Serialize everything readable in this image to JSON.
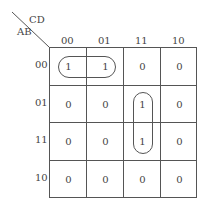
{
  "kmap": {
    "col_var": "CD",
    "row_var": "AB",
    "col_labels": [
      "00",
      "01",
      "11",
      "10"
    ],
    "row_labels": [
      "00",
      "01",
      "11",
      "10"
    ],
    "cells": [
      [
        "1",
        "1",
        "0",
        "0"
      ],
      [
        "0",
        "0",
        "1",
        "0"
      ],
      [
        "0",
        "0",
        "1",
        "0"
      ],
      [
        "0",
        "0",
        "0",
        "0"
      ]
    ],
    "groups": [
      {
        "name": "row-00-cols-00-01",
        "cells": [
          [
            0,
            0
          ],
          [
            0,
            1
          ]
        ]
      },
      {
        "name": "col-11-rows-01-11",
        "cells": [
          [
            1,
            2
          ],
          [
            2,
            2
          ]
        ]
      }
    ]
  }
}
